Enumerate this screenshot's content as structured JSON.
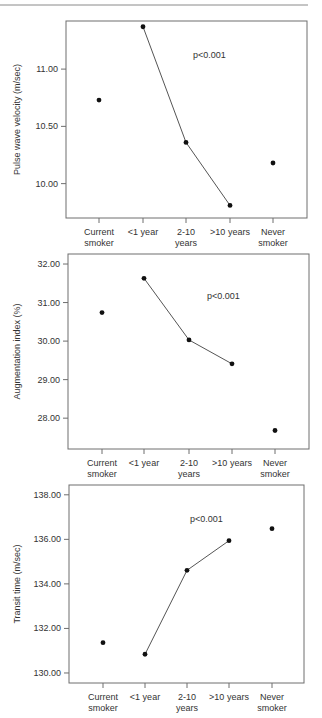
{
  "figure": {
    "top_rule": true,
    "colors": {
      "frame": "#6e6e6e",
      "line": "#555555",
      "point": "#111111",
      "text": "#333333"
    }
  },
  "chart_data": [
    {
      "type": "scatter",
      "title": "",
      "xlabel": "",
      "ylabel": "Pulse wave velocity (m/sec)",
      "categories": [
        "Current smoker",
        "<1 year",
        "2-10 years",
        ">10 years",
        "Never smoker"
      ],
      "category_lines": [
        [
          "Current",
          "smoker"
        ],
        [
          "<1 year"
        ],
        [
          "2-10",
          "years"
        ],
        [
          ">10 years"
        ],
        [
          "Never",
          "smoker"
        ]
      ],
      "values": [
        10.73,
        11.37,
        10.36,
        9.81,
        10.18
      ],
      "connected_indices": [
        1,
        2,
        3
      ],
      "yticks": [
        10.0,
        10.5,
        11.0
      ],
      "ytick_labels": [
        "10.00",
        "10.50",
        "11.00"
      ],
      "ylim": [
        9.7,
        11.42
      ],
      "annotation": "p<0.001",
      "grid": false,
      "legend": "none"
    },
    {
      "type": "scatter",
      "title": "",
      "xlabel": "",
      "ylabel": "Augmentation index (%)",
      "categories": [
        "Current smoker",
        "<1 year",
        "2-10 years",
        ">10 years",
        "Never smoker"
      ],
      "category_lines": [
        [
          "Current",
          "smoker"
        ],
        [
          "<1 year"
        ],
        [
          "2-10",
          "years"
        ],
        [
          ">10 years"
        ],
        [
          "Never",
          "smoker"
        ]
      ],
      "values": [
        30.74,
        31.63,
        30.03,
        29.41,
        27.68
      ],
      "connected_indices": [
        1,
        2,
        3
      ],
      "yticks": [
        28.0,
        29.0,
        30.0,
        31.0,
        32.0
      ],
      "ytick_labels": [
        "28.00",
        "29.00",
        "30.00",
        "31.00",
        "32.00"
      ],
      "ylim": [
        27.2,
        32.26
      ],
      "annotation": "p<0.001",
      "grid": false,
      "legend": "none"
    },
    {
      "type": "scatter",
      "title": "",
      "xlabel": "",
      "ylabel": "Transit time (m/sec)",
      "categories": [
        "Current smoker",
        "<1 year",
        "2-10 years",
        ">10 years",
        "Never smoker"
      ],
      "category_lines": [
        [
          "Current",
          "smoker"
        ],
        [
          "<1 year"
        ],
        [
          "2-10",
          "years"
        ],
        [
          ">10 years"
        ],
        [
          "Never",
          "smoker"
        ]
      ],
      "values": [
        131.36,
        130.84,
        134.61,
        135.94,
        136.48
      ],
      "connected_indices": [
        1,
        2,
        3
      ],
      "yticks": [
        130.0,
        132.0,
        134.0,
        136.0,
        138.0
      ],
      "ytick_labels": [
        "130.00",
        "132.00",
        "134.00",
        "136.00",
        "138.00"
      ],
      "ylim": [
        129.55,
        138.44
      ],
      "annotation": "p<0.001",
      "grid": false,
      "legend": "none"
    }
  ],
  "layout": [
    {
      "frame": [
        66,
        21,
        307,
        218
      ],
      "tick_len": 5,
      "xticks": [
        99,
        143,
        186,
        230,
        273
      ],
      "ylabel_x": 20,
      "annot_xy": [
        193,
        58
      ]
    },
    {
      "frame": [
        68,
        254,
        309,
        449
      ],
      "tick_len": 5,
      "xticks": [
        102,
        144,
        189,
        232,
        275
      ],
      "ylabel_x": 20,
      "annot_xy": [
        207,
        299
      ]
    },
    {
      "frame": [
        69,
        485,
        304,
        683
      ],
      "tick_len": 5,
      "xticks": [
        103,
        145,
        187,
        229,
        272
      ],
      "ylabel_x": 20,
      "annot_xy": [
        190,
        522
      ]
    }
  ]
}
